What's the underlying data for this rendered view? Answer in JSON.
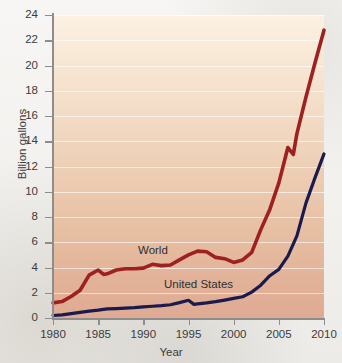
{
  "chart_data": {
    "type": "line",
    "title": "",
    "xlabel": "Year",
    "ylabel": "Billion gallons",
    "xlim": [
      1980,
      2010
    ],
    "ylim": [
      0,
      24
    ],
    "ytick_labels": [
      "24",
      "22",
      "20",
      "18",
      "16",
      "14",
      "12",
      "10",
      "8",
      "6",
      "4",
      "2",
      "0"
    ],
    "ytick_values": [
      24,
      22,
      20,
      18,
      16,
      14,
      12,
      10,
      8,
      6,
      4,
      2,
      0
    ],
    "xtick_labels": [
      "1980",
      "1985",
      "1990",
      "1995",
      "2000",
      "2005",
      "2010"
    ],
    "xtick_values": [
      1980,
      1985,
      1990,
      1995,
      2000,
      2005,
      2010
    ],
    "grid": "horizontal",
    "legend_position": "inline-labels",
    "series": [
      {
        "name": "World",
        "color": "#9e2020",
        "x": [
          1980,
          1981,
          1982,
          1983,
          1984,
          1985,
          1985.6,
          1986,
          1987,
          1988,
          1989,
          1990,
          1991,
          1992,
          1993,
          1994,
          1995,
          1996,
          1997,
          1998,
          1999,
          2000,
          2001,
          2002,
          2003,
          2004,
          2005,
          2006,
          2006.6,
          2007,
          2008,
          2009,
          2010
        ],
        "values": [
          1.2,
          1.3,
          1.7,
          2.2,
          3.4,
          3.8,
          3.45,
          3.5,
          3.8,
          3.9,
          3.9,
          3.95,
          4.25,
          4.15,
          4.2,
          4.6,
          5.0,
          5.3,
          5.25,
          4.8,
          4.7,
          4.4,
          4.6,
          5.2,
          7.0,
          8.6,
          10.7,
          13.5,
          12.95,
          14.6,
          17.5,
          20.2,
          22.8
        ]
      },
      {
        "name": "United States",
        "color": "#1a1a4e",
        "x": [
          1980,
          1981,
          1982,
          1983,
          1984,
          1985,
          1986,
          1987,
          1988,
          1989,
          1990,
          1991,
          1992,
          1993,
          1994,
          1995,
          1995.6,
          1996,
          1997,
          1998,
          1999,
          2000,
          2001,
          2002,
          2003,
          2004,
          2005,
          2006,
          2007,
          2008,
          2009,
          2010
        ],
        "values": [
          0.2,
          0.25,
          0.35,
          0.45,
          0.55,
          0.62,
          0.72,
          0.75,
          0.78,
          0.82,
          0.88,
          0.93,
          0.98,
          1.05,
          1.22,
          1.4,
          1.08,
          1.12,
          1.2,
          1.3,
          1.42,
          1.55,
          1.68,
          2.05,
          2.6,
          3.35,
          3.85,
          4.9,
          6.5,
          9.1,
          11.1,
          13.0
        ]
      }
    ]
  },
  "labels": {
    "world": "World",
    "united_states": "United States"
  }
}
